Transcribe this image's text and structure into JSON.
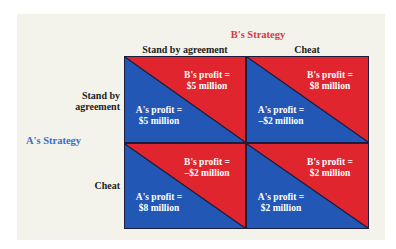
{
  "diagram": {
    "title_b": "B's Strategy",
    "title_a": "A's Strategy",
    "columns": [
      "Stand by agreement",
      "Cheat"
    ],
    "rows": [
      {
        "label_line1": "Stand by",
        "label_line2": "agreement"
      },
      {
        "label_line1": "Cheat",
        "label_line2": ""
      }
    ],
    "cells": [
      [
        {
          "b_label": "B's profit =",
          "b_value": "$5 million",
          "a_label": "A's profit =",
          "a_value": "$5 million"
        },
        {
          "b_label": "B's profit =",
          "b_value": "$8 million",
          "a_label": "A's profit =",
          "a_value": "–$2 million"
        }
      ],
      [
        {
          "b_label": "B's profit =",
          "b_value": "–$2 million",
          "a_label": "A's profit =",
          "a_value": "$8 million"
        },
        {
          "b_label": "B's profit =",
          "b_value": "$2 million",
          "a_label": "A's profit =",
          "a_value": "$2 million"
        }
      ]
    ],
    "colors": {
      "b_red": "#e0252e",
      "a_blue": "#2257b5",
      "b_title": "#d9363e",
      "a_title": "#3a6fc4",
      "panel_bg": "#f3f3ec"
    }
  }
}
